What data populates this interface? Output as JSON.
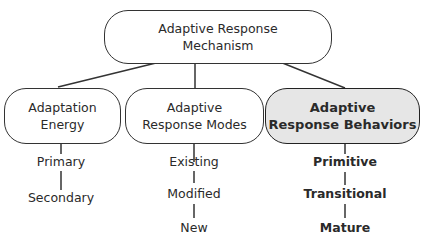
{
  "root": {
    "line1": "Adaptive Response",
    "line2": "Mechanism"
  },
  "branches": [
    {
      "line1": "Adaptation",
      "line2": "Energy",
      "highlighted": false,
      "items": [
        "Primary",
        "Secondary"
      ]
    },
    {
      "line1": "Adaptive",
      "line2": "Response Modes",
      "highlighted": false,
      "items": [
        "Existing",
        "Modified",
        "New"
      ]
    },
    {
      "line1": "Adaptive",
      "line2": "Response Behaviors",
      "highlighted": true,
      "items": [
        "Primitive",
        "Transitional",
        "Mature"
      ]
    }
  ],
  "colors": {
    "line": "#333333",
    "highlight_fill": "#e6e6e6"
  }
}
